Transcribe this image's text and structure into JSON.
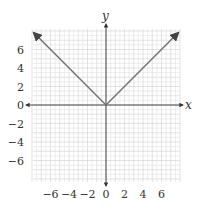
{
  "chart_data": {
    "type": "line",
    "title": "",
    "function": "y = |x|",
    "xlabel": "x",
    "ylabel": "y",
    "xlim": [
      -8,
      8
    ],
    "ylim": [
      -8,
      8
    ],
    "grid": true,
    "x_ticks": [
      -6,
      -4,
      -2,
      0,
      2,
      4,
      6
    ],
    "y_ticks": [
      6,
      4,
      2,
      0,
      -2,
      -4,
      -6
    ],
    "x_tick_labels": [
      "−6",
      "−4",
      "−2",
      "0",
      "2",
      "4",
      "6"
    ],
    "y_tick_labels": [
      "6",
      "4",
      "2",
      "0",
      "−2",
      "−4",
      "−6"
    ],
    "series": [
      {
        "name": "y = |x|",
        "x": [
          -7.8,
          0,
          7.8
        ],
        "y": [
          7.8,
          0,
          7.8
        ],
        "arrows": "both-ends"
      }
    ],
    "colors": {
      "line": "#707070",
      "axis": "#333333",
      "grid": "#e2e2e2",
      "grid_major": "#d0d0d0"
    }
  }
}
